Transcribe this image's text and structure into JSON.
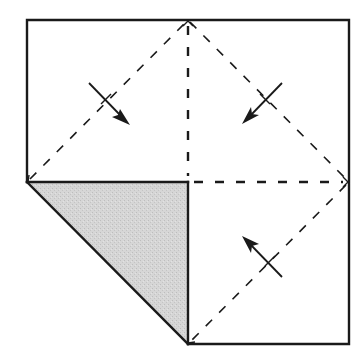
{
  "diagram": {
    "title": "",
    "type": "origami-fold-diagram",
    "colors": {
      "line": "#1a1a1a",
      "shade": "#d2d2d2",
      "background": "#ffffff"
    },
    "outline": {
      "points": [
        [
          27,
          20
        ],
        [
          349,
          20
        ],
        [
          349,
          344
        ],
        [
          188,
          344
        ],
        [
          27,
          182
        ]
      ]
    },
    "shaded_triangle": {
      "points": [
        [
          27,
          182
        ],
        [
          188,
          182
        ],
        [
          188,
          344
        ]
      ],
      "label": ""
    },
    "dashed_lines": [
      {
        "name": "diag-top-left",
        "from": [
          27,
          182
        ],
        "to": [
          188,
          20
        ]
      },
      {
        "name": "diag-top-right",
        "from": [
          188,
          20
        ],
        "to": [
          349,
          182
        ]
      },
      {
        "name": "diag-bottom-right",
        "from": [
          349,
          182
        ],
        "to": [
          188,
          344
        ]
      },
      {
        "name": "vertical-center",
        "from": [
          188,
          20
        ],
        "to": [
          188,
          182
        ]
      },
      {
        "name": "horizontal-center",
        "from": [
          188,
          182
        ],
        "to": [
          349,
          182
        ]
      }
    ],
    "fold_arrows": [
      {
        "name": "arrow-top-left",
        "from": [
          89,
          83
        ],
        "to": [
          130,
          125
        ],
        "direction": "down-right"
      },
      {
        "name": "arrow-top-right",
        "from": [
          282,
          83
        ],
        "to": [
          242,
          124
        ],
        "direction": "down-left"
      },
      {
        "name": "arrow-bottom-right",
        "from": [
          282,
          277
        ],
        "to": [
          242,
          236
        ],
        "direction": "up-left"
      }
    ]
  }
}
